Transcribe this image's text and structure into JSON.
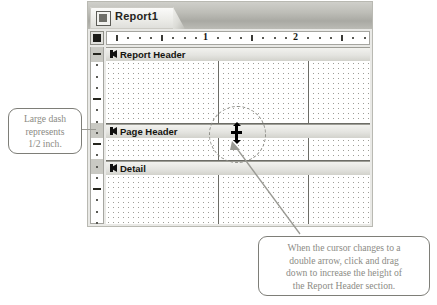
{
  "window": {
    "tab_label": "Report1",
    "tab_icon": "report-document-icon",
    "select_all_icon": "select-all-box-icon"
  },
  "rulers": {
    "horizontal": {
      "unit_labels": [
        "1",
        "2"
      ],
      "major_ticks": [
        1,
        2
      ],
      "minor_ticks_per_unit": 8
    },
    "vertical": {
      "major_dash_note": "large dash = 1/2 inch"
    }
  },
  "design_surface": {
    "sections": [
      {
        "label": "Report Header",
        "flag_icon": "section-flag-icon"
      },
      {
        "label": "Page Header",
        "flag_icon": "section-flag-icon"
      },
      {
        "label": "Detail",
        "flag_icon": "section-flag-icon"
      }
    ]
  },
  "cursor": {
    "icon": "vertical-double-arrow-resize-cursor"
  },
  "callouts": [
    {
      "id": "left",
      "lines": [
        "Large dash",
        "represents",
        "1/2 inch."
      ]
    },
    {
      "id": "bottom",
      "lines": [
        "When the cursor changes to a",
        "double arrow, click and drag",
        "down to increase the height of",
        "the Report Header section."
      ]
    }
  ],
  "colors": {
    "page_background": "#ffffff",
    "window_chrome": "#e9e9e6",
    "titlebar_gradient_top": "#cfcfca",
    "titlebar_gradient_bottom": "#a9a9a3",
    "section_bar": "#e4e4e0",
    "grid_dot": "#9d9d97",
    "grid_line": "#6c6c66",
    "callout_border": "#7e7e78",
    "callout_text": "#8b8b85",
    "cursor": "#000000"
  }
}
